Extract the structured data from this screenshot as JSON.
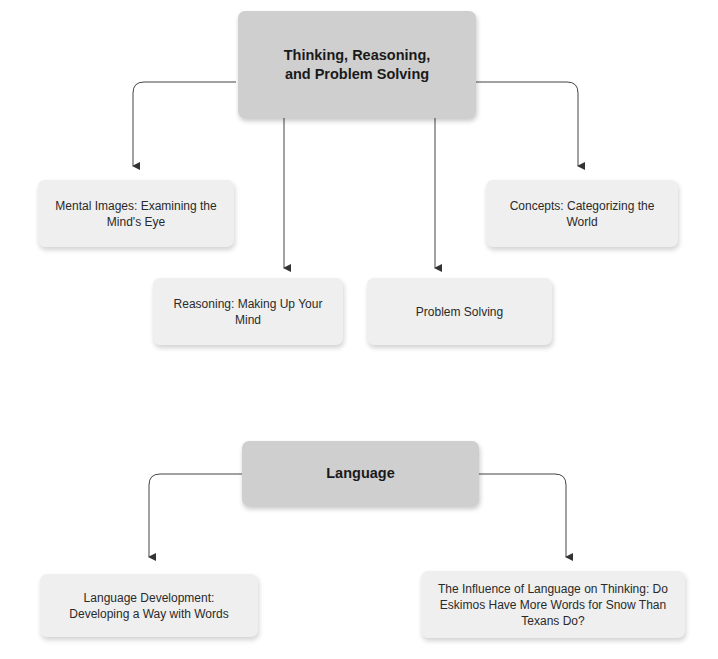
{
  "diagrams": [
    {
      "root": {
        "label": "Thinking, Reasoning, and Problem Solving"
      },
      "children": [
        {
          "label": "Mental Images: Examining the Mind's Eye"
        },
        {
          "label": "Reasoning: Making Up Your Mind"
        },
        {
          "label": "Problem Solving"
        },
        {
          "label": "Concepts: Categorizing the World"
        }
      ]
    },
    {
      "root": {
        "label": "Language"
      },
      "children": [
        {
          "label": "Language Development: Developing a Way with Words"
        },
        {
          "label": "The Influence of Language on Thinking: Do Eskimos Have More Words for Snow Than Texans Do?"
        }
      ]
    }
  ],
  "colors": {
    "root_fill": "#cfcfcf",
    "child_fill": "#efefef",
    "connector": "#333333"
  }
}
